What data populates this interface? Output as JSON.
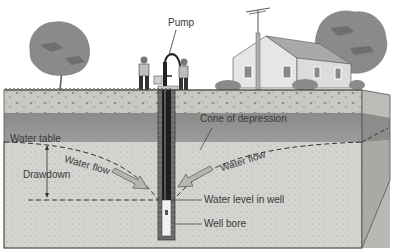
{
  "labels": {
    "pump": "Pump",
    "cone_of_depression": "Cone of depression",
    "water_table": "Water table",
    "water_flow_left": "Water flow",
    "water_flow_right": "Water flow",
    "drawdown": "Drawdown",
    "water_level_in_well": "Water level in well",
    "well_bore": "Well bore"
  },
  "colors": {
    "sky": "#ffffff",
    "topsoil": "#c9c9c4",
    "unsaturated": "#8e8e8c",
    "saturated": "#d4d4d0",
    "side_face": "#a9a9a6",
    "tree": "#8a8a88",
    "house": "#e6e6e6",
    "well": "#2a2a2a"
  }
}
